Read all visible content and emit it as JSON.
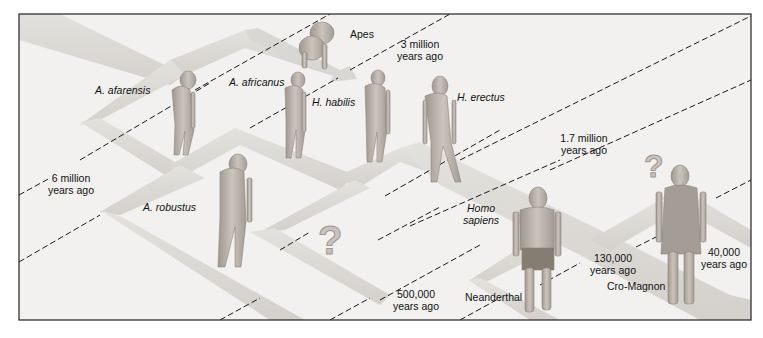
{
  "diagram": {
    "colors": {
      "background": "#f2f1ef",
      "band": "#dcdad6",
      "band_edge": "#c8c5c0",
      "frame": "#222222",
      "figure": "#b9b2ac",
      "question_mark": "#c9c3bc"
    },
    "species": [
      {
        "id": "apes",
        "label": "Apes",
        "italic": false
      },
      {
        "id": "a-afarensis",
        "label": "A. afarensis",
        "italic": true
      },
      {
        "id": "a-africanus",
        "label": "A. africanus",
        "italic": true
      },
      {
        "id": "h-habilis",
        "label": "H. habilis",
        "italic": true
      },
      {
        "id": "h-erectus",
        "label": "H. erectus",
        "italic": true
      },
      {
        "id": "a-robustus",
        "label": "A. robustus",
        "italic": true
      },
      {
        "id": "homo-sapiens",
        "label_line1": "Homo",
        "label_line2": "sapiens",
        "italic": true
      },
      {
        "id": "neanderthal",
        "label": "Neanderthal",
        "italic": false
      },
      {
        "id": "cro-magnon",
        "label": "Cro-Magnon",
        "italic": false
      }
    ],
    "time_markers": [
      {
        "id": "6-million",
        "line1": "6 million",
        "line2": "years ago"
      },
      {
        "id": "3-million",
        "line1": "3 million",
        "line2": "years ago"
      },
      {
        "id": "1-7-million",
        "line1": "1.7 million",
        "line2": "years ago"
      },
      {
        "id": "500000",
        "line1": "500,000",
        "line2": "years ago"
      },
      {
        "id": "130000",
        "line1": "130,000",
        "line2": "years ago"
      },
      {
        "id": "40000",
        "line1": "40,000",
        "line2": "years ago"
      }
    ],
    "unknowns": [
      {
        "id": "question-1",
        "symbol": "?"
      },
      {
        "id": "question-2",
        "symbol": "?"
      }
    ]
  }
}
